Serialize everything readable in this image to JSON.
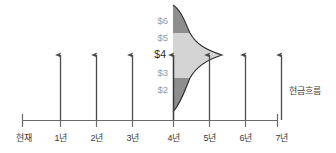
{
  "diagram": {
    "type": "cash-flow-timeline-with-distribution",
    "axis": {
      "baseline_y": 120,
      "x_start": 22,
      "x_end": 277,
      "tick_spacing": 36
    },
    "timeline_ticks": [
      {
        "label": "현재",
        "x": 24,
        "has_arrow": false
      },
      {
        "label": "1년",
        "x": 60,
        "has_arrow": true
      },
      {
        "label": "2년",
        "x": 96,
        "has_arrow": true
      },
      {
        "label": "3년",
        "x": 132,
        "has_arrow": true
      },
      {
        "label": "4년",
        "x": 173,
        "has_arrow": true
      },
      {
        "label": "5년",
        "x": 209,
        "has_arrow": true
      },
      {
        "label": "6년",
        "x": 245,
        "has_arrow": true
      },
      {
        "label": "7년",
        "x": 281,
        "has_arrow": true
      }
    ],
    "value_labels": [
      {
        "text": "$6",
        "y": 20,
        "emphasis": false
      },
      {
        "text": "$5",
        "y": 37,
        "emphasis": false
      },
      {
        "text": "$4",
        "y": 54,
        "emphasis": true
      },
      {
        "text": "$3",
        "y": 72,
        "emphasis": false
      },
      {
        "text": "$2",
        "y": 89,
        "emphasis": false
      }
    ],
    "distribution": {
      "description": "normal distribution rotated 90 degrees, centered at $4 on the 4-year cash flow",
      "mean_label": "$4",
      "center_y": 55,
      "base_x": 173,
      "peak_x": 222,
      "top_y": 5,
      "bottom_y": 112,
      "upper_tail_boundary_y": 33,
      "lower_tail_boundary_y": 78,
      "body_fill": "#d4d4d4",
      "tail_fill": "#8e8e8e",
      "outline": "#2b2b2b"
    },
    "side_label": {
      "text": "현금흐름",
      "x": 289,
      "y": 84
    },
    "colors": {
      "axis": "#6a6a6a",
      "arrow": "#4a4a4a",
      "text": "#3a3a3a",
      "muted_text": "#9a9a9a",
      "body_fill": "#d4d4d4",
      "tail_fill": "#8e8e8e"
    }
  }
}
